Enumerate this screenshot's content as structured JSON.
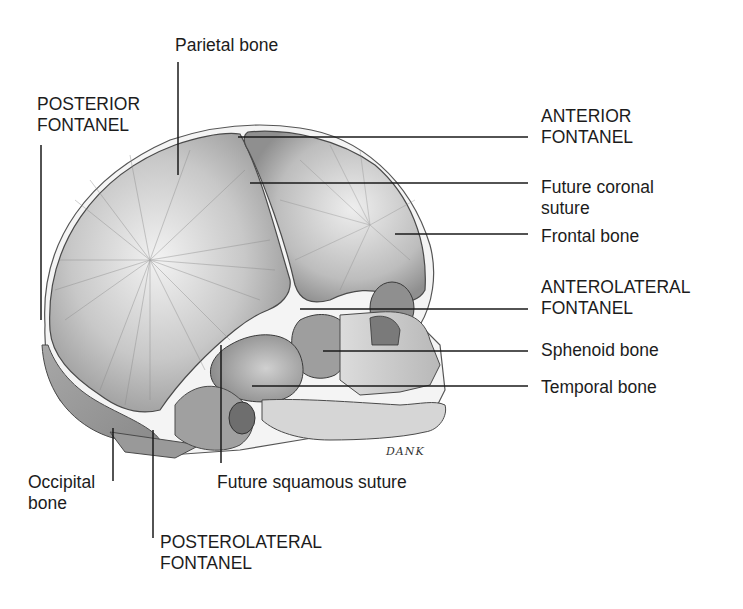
{
  "figure": {
    "signature": "DANK",
    "colors": {
      "background": "#ffffff",
      "bone_light": "#e6e6e6",
      "bone_mid": "#b0b0b0",
      "bone_dark": "#8a8a8a",
      "outline": "#4a4a4a",
      "leader_line": "#1a1a1a",
      "text": "#1c1c1c"
    }
  },
  "labels": {
    "parietal_bone": "Parietal bone",
    "posterior_fontanel": "POSTERIOR\nFONTANEL",
    "anterior_fontanel": "ANTERIOR\nFONTANEL",
    "future_coronal_suture": "Future coronal\nsuture",
    "frontal_bone": "Frontal bone",
    "anterolateral_fontanel": "ANTEROLATERAL\nFONTANEL",
    "sphenoid_bone": "Sphenoid bone",
    "temporal_bone": "Temporal bone",
    "occipital_bone": "Occipital\nbone",
    "future_squamous_suture": "Future squamous suture",
    "posterolateral_fontanel": "POSTEROLATERAL\nFONTANEL"
  }
}
